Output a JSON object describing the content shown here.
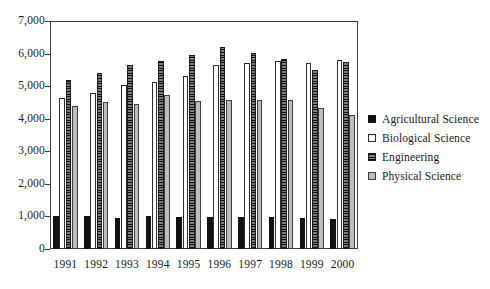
{
  "chart_data": {
    "type": "bar",
    "title": "",
    "subtitle": "",
    "xlabel": "",
    "ylabel": "",
    "ylim": [
      0,
      7000
    ],
    "ytick_labels": [
      "0",
      "1,000",
      "2,000",
      "3,000",
      "4,000",
      "5,000",
      "6,000",
      "7,000"
    ],
    "ytick_values": [
      0,
      1000,
      2000,
      3000,
      4000,
      5000,
      6000,
      7000
    ],
    "grid": false,
    "legend_position": "right",
    "categories": [
      "1991",
      "1992",
      "1993",
      "1994",
      "1995",
      "1996",
      "1997",
      "1998",
      "1999",
      "2000"
    ],
    "series": [
      {
        "name": "Agricultural Science",
        "key": "agricultural",
        "color": "#121212",
        "pattern": "solid-black",
        "values": [
          1020,
          1010,
          950,
          1020,
          990,
          990,
          980,
          980,
          950,
          920
        ]
      },
      {
        "name": "Biological Science",
        "key": "biological",
        "color": "#ffffff",
        "pattern": "open-white",
        "values": [
          4650,
          4800,
          5050,
          5130,
          5300,
          5650,
          5720,
          5760,
          5700,
          5790
        ]
      },
      {
        "name": "Engineering",
        "key": "engineering",
        "color": "#5a5a5a",
        "pattern": "dark-hatched",
        "values": [
          5180,
          5400,
          5650,
          5770,
          5950,
          6210,
          6030,
          5830,
          5500,
          5740
        ]
      },
      {
        "name": "Physical Science",
        "key": "physical",
        "color": "#bdbdbd",
        "pattern": "light-gray",
        "values": [
          4400,
          4520,
          4440,
          4730,
          4550,
          4560,
          4590,
          4560,
          4320,
          4100
        ]
      }
    ]
  },
  "legend": {
    "items": [
      {
        "label": "Agricultural Science",
        "key": "agricultural"
      },
      {
        "label": "Biological Science",
        "key": "biological"
      },
      {
        "label": "Engineering",
        "key": "engineering"
      },
      {
        "label": "Physical Science",
        "key": "physical"
      }
    ]
  }
}
